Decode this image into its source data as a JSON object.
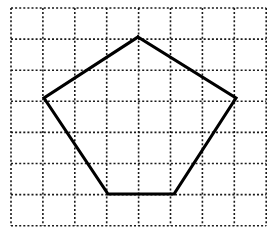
{
  "figure": {
    "background_color": "#ffffff",
    "width": 270,
    "height": 243
  },
  "grid": {
    "name": "dotted-square-grid",
    "line_color": "#1a1a1a",
    "line_style": "dotted",
    "line_width": 1.6,
    "dash_pattern": "2 2",
    "columns": 8,
    "rows": 7,
    "cell_width": 31.9,
    "cell_height": 31.1,
    "origin_x": 11,
    "origin_y": 8,
    "x_positions": [
      11,
      42.9,
      74.8,
      106.7,
      138.6,
      170.5,
      202.4,
      234.3,
      266.2
    ],
    "y_positions": [
      8,
      39.1,
      70.2,
      101.3,
      132.4,
      163.5,
      194.6,
      225.7
    ]
  },
  "shape": {
    "name": "pentagon",
    "type": "polygon",
    "sides": 5,
    "stroke_color": "#000000",
    "fill": "none",
    "stroke_width": 3.1,
    "vertices": [
      {
        "label": "top",
        "x": 138,
        "y": 37
      },
      {
        "label": "right",
        "x": 236,
        "y": 98
      },
      {
        "label": "bottom-right",
        "x": 174,
        "y": 194
      },
      {
        "label": "bottom-left",
        "x": 108,
        "y": 194
      },
      {
        "label": "left",
        "x": 44,
        "y": 98
      }
    ],
    "points_attr": "138,37 236,98 174,194 108,194 44,98"
  },
  "chart_data": {
    "type": "scatter",
    "xlabel": "",
    "ylabel": "",
    "grid": true,
    "legend": "none",
    "xlim": [
      0,
      8
    ],
    "ylim": [
      0,
      7
    ],
    "x": [
      4,
      7,
      5,
      3,
      1
    ],
    "y": [
      6,
      4,
      1,
      1,
      4
    ],
    "categories": [
      "top",
      "right",
      "bottom-right",
      "bottom-left",
      "left"
    ],
    "values": [
      6,
      4,
      1,
      1,
      4
    ],
    "annotations": [
      "pentagon drawn with 5 straight black segments over an 8x7 dotted grid"
    ]
  }
}
